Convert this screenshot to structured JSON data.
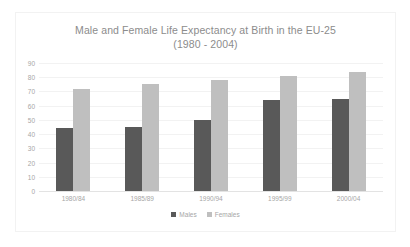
{
  "chart_data": {
    "type": "bar",
    "title": "Male and Female Life Expectancy at Birth in the EU-25",
    "subtitle": "(1980 - 2004)",
    "xlabel": "",
    "ylabel": "",
    "categories": [
      "1980/84",
      "1985/89",
      "1990/94",
      "1995/99",
      "2000/04"
    ],
    "series": [
      {
        "name": "Males",
        "color": "#595959",
        "values": [
          44,
          45,
          50,
          64,
          65
        ]
      },
      {
        "name": "Females",
        "color": "#bfbfbf",
        "values": [
          72,
          75,
          78,
          81,
          84
        ]
      }
    ],
    "ylim": [
      0,
      90
    ],
    "yticks": [
      90,
      80,
      70,
      60,
      50,
      40,
      30,
      20,
      10,
      0
    ],
    "grid": true,
    "legend_position": "bottom"
  },
  "legend": {
    "items": [
      {
        "label": "Males",
        "marker": "square-marker",
        "color": "#595959"
      },
      {
        "label": "Females",
        "marker": "square-marker",
        "color": "#bfbfbf"
      }
    ]
  }
}
